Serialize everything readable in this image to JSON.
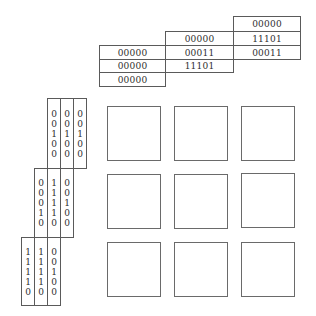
{
  "top_matrix": {
    "columns": [
      {
        "cells": [
          "00000",
          "00000",
          "00000"
        ]
      },
      {
        "cells": [
          "00000",
          "00011",
          "11101"
        ]
      },
      {
        "cells": [
          "00000",
          "11101",
          "00011"
        ]
      }
    ]
  },
  "left_matrix": {
    "groups": [
      {
        "columns": [
          [
            "0",
            "0",
            "1",
            "0",
            "0"
          ],
          [
            "0",
            "0",
            "1",
            "0",
            "0"
          ],
          [
            "0",
            "0",
            "1",
            "0",
            "0"
          ]
        ]
      },
      {
        "columns": [
          [
            "0",
            "0",
            "0",
            "1",
            "0"
          ],
          [
            "1",
            "1",
            "1",
            "1",
            "0"
          ],
          [
            "0",
            "0",
            "1",
            "0",
            "0"
          ]
        ]
      },
      {
        "columns": [
          [
            "1",
            "1",
            "1",
            "1",
            "0"
          ],
          [
            "1",
            "1",
            "1",
            "1",
            "0"
          ],
          [
            "0",
            "0",
            "1",
            "0",
            "0"
          ]
        ]
      }
    ]
  },
  "grid": {
    "rows": 3,
    "cols": 3,
    "cells": [
      "",
      "",
      "",
      "",
      "",
      "",
      "",
      "",
      ""
    ]
  }
}
